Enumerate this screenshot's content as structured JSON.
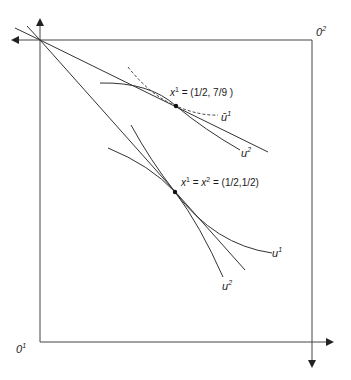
{
  "diagram": {
    "type": "edgeworth-box",
    "colors": {
      "line": "#333333",
      "axis": "#444444",
      "point": "#111111",
      "background": "#ffffff"
    },
    "origins": {
      "agent1": {
        "base": "0",
        "sup": "1"
      },
      "agent2": {
        "base": "0",
        "sup": "2"
      }
    },
    "points": {
      "upper": {
        "label_var": "x",
        "label_sup": "1",
        "label_rest": " = (1/2, 7/9 )"
      },
      "lower": {
        "label_var1": "x",
        "label_sup1": "1",
        "label_eq": " = ",
        "label_var2": "x",
        "label_sup2": "2",
        "label_rest": " = (1/2,1/2)"
      }
    },
    "curve_labels": {
      "u1_bar": {
        "base": "ū",
        "sup": "1"
      },
      "u2_upper": {
        "base": "u",
        "sup": "2"
      },
      "u1_lower": {
        "base": "u",
        "sup": "1"
      },
      "u2_lower": {
        "base": "u",
        "sup": "2"
      }
    }
  }
}
